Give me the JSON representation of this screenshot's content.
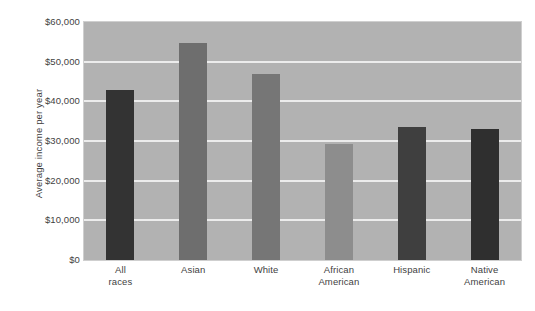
{
  "chart_data": {
    "type": "bar",
    "title": "",
    "subtitle": "",
    "xlabel": "",
    "ylabel": "Average income per year",
    "categories": [
      "All races",
      "Asian",
      "White",
      "African American",
      "Hispanic",
      "Native American"
    ],
    "values": [
      42800,
      54700,
      46800,
      29300,
      33600,
      33000
    ],
    "bar_colors": [
      "#333333",
      "#6e6e6e",
      "#767676",
      "#8d8d8d",
      "#3f3f3f",
      "#2f2f2f"
    ],
    "ylim": [
      0,
      60000
    ],
    "ytick_values": [
      0,
      10000,
      20000,
      30000,
      40000,
      50000,
      60000
    ],
    "ytick_labels": [
      "$0",
      "$10,000",
      "$20,000",
      "$30,000",
      "$40,000",
      "$50,000",
      "$60,000"
    ],
    "grid": true,
    "gridline_color": "#ececec",
    "plot_background": "#b2b2b2",
    "legend": [],
    "legend_position": "none",
    "annotations": []
  }
}
